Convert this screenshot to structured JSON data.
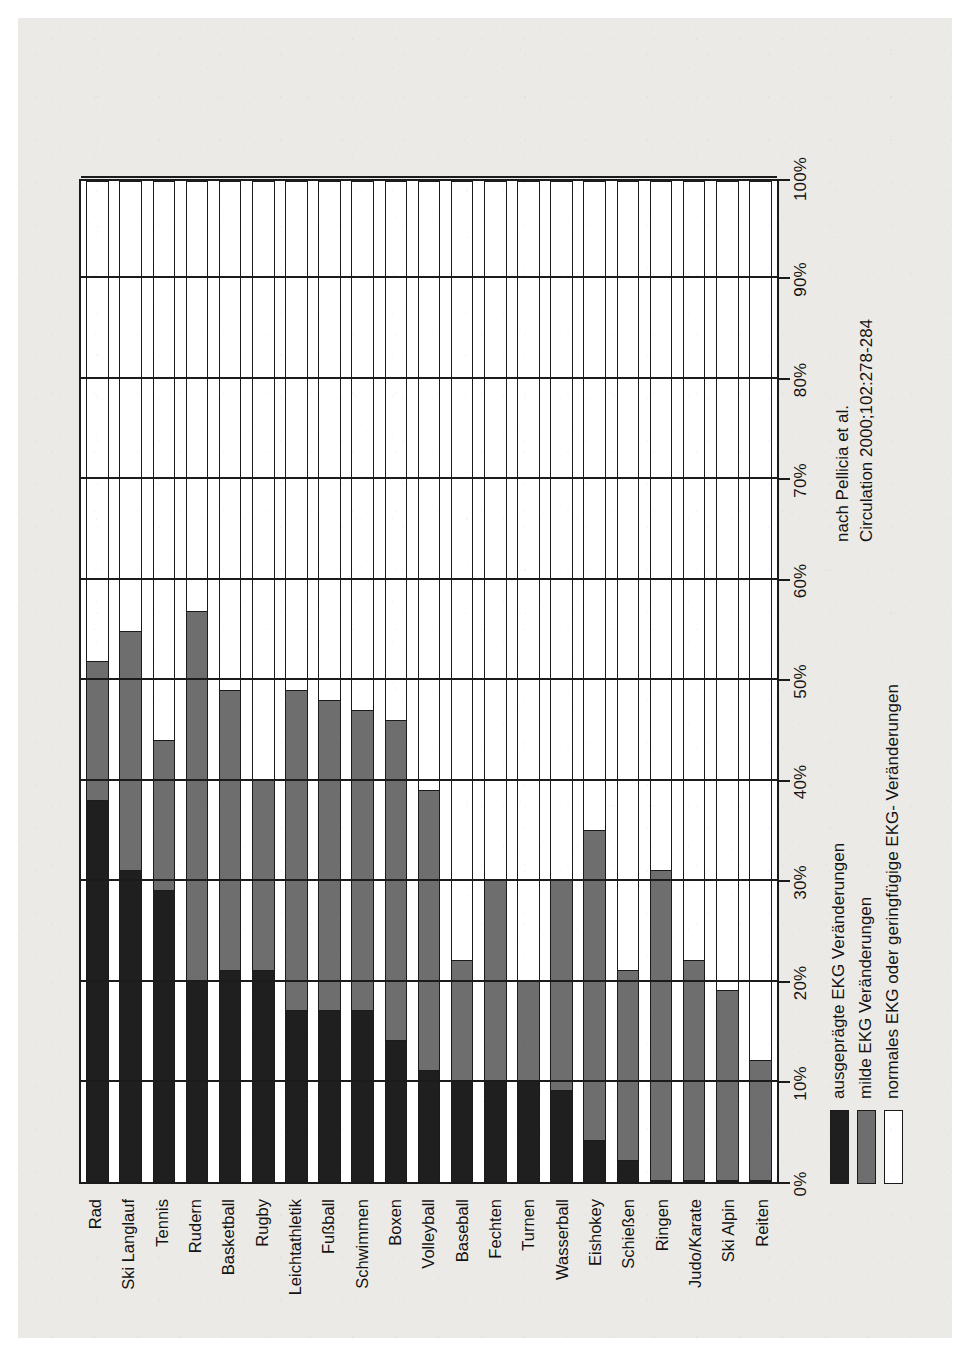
{
  "chart_data": {
    "type": "bar",
    "subtype": "stacked-horizontal-100pct",
    "title": "",
    "xlabel": "",
    "ylabel": "",
    "xlim": [
      0,
      100
    ],
    "grid": true,
    "legend_position": "below-left",
    "orientation_note": "figure is printed rotated 90 degrees on the page",
    "axis_ticks": [
      "0%",
      "10%",
      "20%",
      "30%",
      "40%",
      "50%",
      "60%",
      "70%",
      "80%",
      "90%",
      "100%"
    ],
    "categories": [
      "Rad",
      "Ski Langlauf",
      "Tennis",
      "Rudern",
      "Basketball",
      "Rugby",
      "Leichtathletik",
      "Fußball",
      "Schwimmen",
      "Boxen",
      "Volleyball",
      "Baseball",
      "Fechten",
      "Turnen",
      "Wasserball",
      "Eishokey",
      "Schießen",
      "Ringen",
      "Judo/Karate",
      "Ski Alpin",
      "Reiten"
    ],
    "series": [
      {
        "name": "ausgeprägte EKG Veränderungen",
        "color": "#201f1f",
        "values": [
          38,
          31,
          29,
          20,
          21,
          21,
          17,
          17,
          17,
          14,
          11,
          10,
          10,
          10,
          9,
          4,
          2,
          0,
          0,
          0,
          0
        ]
      },
      {
        "name": "milde EKG Veränderungen",
        "color": "#6e6e6e",
        "values": [
          14,
          24,
          15,
          37,
          28,
          19,
          32,
          31,
          30,
          32,
          28,
          12,
          20,
          10,
          21,
          31,
          19,
          31,
          22,
          19,
          12
        ]
      },
      {
        "name": "normales EKG oder geringfügige EKG- Veränderungen",
        "color": "#ffffff",
        "values": [
          48,
          45,
          56,
          43,
          51,
          60,
          51,
          52,
          53,
          54,
          61,
          78,
          70,
          80,
          70,
          65,
          79,
          69,
          78,
          81,
          88
        ]
      }
    ]
  },
  "legend": {
    "items": [
      {
        "label": "ausgeprägte EKG Veränderungen",
        "swatch": "black"
      },
      {
        "label": "milde EKG Veränderungen",
        "swatch": "gray"
      },
      {
        "label": "normales EKG oder geringfügige EKG- Veränderungen",
        "swatch": "white"
      }
    ]
  },
  "source": {
    "line1": "nach Pellicia et al.",
    "line2": "Circulation 2000;102:278-284"
  },
  "colors": {
    "severe": "#201f1f",
    "mild": "#6e6e6e",
    "normal": "#ffffff",
    "frame": "#1b1b1b",
    "paper": "#eceae7"
  }
}
